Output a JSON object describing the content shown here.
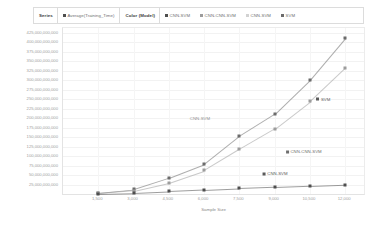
{
  "legend": {
    "series_title": "Series",
    "series_entries": [
      {
        "label": "Average(Training_Time)",
        "color": "#4e4e4e",
        "marker": "square"
      }
    ],
    "color_title": "Color (Model)",
    "color_entries": [
      {
        "label": "CNN-SVM",
        "color": "#4e4e4e",
        "marker": "square"
      },
      {
        "label": "CNN-CNN-SVM",
        "color": "#9c9c9c",
        "marker": "square"
      },
      {
        "label": "CNN-SVM",
        "color": "#c8c8c8",
        "marker": "square"
      },
      {
        "label": "SVM",
        "color": "#6b6b6b",
        "marker": "square"
      }
    ]
  },
  "axes": {
    "x_title": "Sample Size",
    "x_ticks": [
      "1,500",
      "3,000",
      "4,500",
      "6,000",
      "7,500",
      "9,000",
      "10,500",
      "12,000"
    ],
    "y_ticks": [
      "425,000,000,000",
      "400,000,000,000",
      "375,000,000,000",
      "350,000,000,000",
      "325,000,000,000",
      "300,000,000,000",
      "275,000,000,000",
      "250,000,000,000",
      "225,000,000,000",
      "200,000,000,000",
      "175,000,000,000",
      "150,000,000,000",
      "125,000,000,000",
      "100,000,000,000",
      "75,000,000,000",
      "50,000,000,000",
      "25,000,000,000"
    ],
    "y_title": "Average(Training_Time)"
  },
  "annotations": [
    {
      "text": "CNN-SVM",
      "marker": false,
      "color": "#8f8f8f",
      "x_pct": 45.5,
      "y_pct": 54.5
    },
    {
      "text": "SVM",
      "marker": true,
      "color": "#5a5a5a",
      "x_pct": 86.5,
      "y_pct": 42.8
    },
    {
      "text": "CNN-CNN-SVM",
      "marker": true,
      "color": "#6e6e6e",
      "x_pct": 80.0,
      "y_pct": 74.2
    },
    {
      "text": "CNN-SVM",
      "marker": true,
      "color": "#5a5a5a",
      "x_pct": 70.5,
      "y_pct": 87.5
    }
  ],
  "chart_data": {
    "type": "scatter",
    "title": "",
    "xlabel": "Sample Size",
    "ylabel": "Average(Training_Time)",
    "xlim": [
      0,
      12800
    ],
    "ylim": [
      0,
      437500000000
    ],
    "grid": true,
    "legend_position": "top",
    "x": [
      1500,
      3000,
      4500,
      6000,
      7500,
      9000,
      10500,
      12000
    ],
    "series": [
      {
        "name": "SVM",
        "color": "#6b6b6b",
        "marker": "square",
        "trend": true,
        "values": [
          3000000000,
          12000000000,
          42000000000,
          78000000000,
          152000000000,
          210000000000,
          300000000000,
          410000000000
        ]
      },
      {
        "name": "CNN-CNN-SVM",
        "color": "#9c9c9c",
        "marker": "square",
        "trend": true,
        "values": [
          2000000000,
          9000000000,
          30000000000,
          62000000000,
          118000000000,
          172000000000,
          244000000000,
          332000000000
        ]
      },
      {
        "name": "CNN-SVM",
        "color": "#4e4e4e",
        "marker": "square",
        "trend": true,
        "values": [
          1000000000,
          3000000000,
          7000000000,
          11000000000,
          15000000000,
          18000000000,
          21000000000,
          24000000000
        ]
      }
    ]
  }
}
